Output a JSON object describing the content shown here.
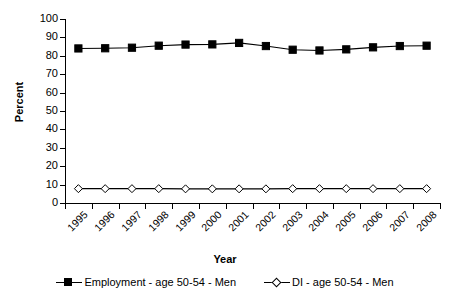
{
  "chart_data": {
    "type": "line",
    "title": "",
    "xlabel": "Year",
    "ylabel": "Percent",
    "ylim": [
      0,
      100
    ],
    "ytick_step": 10,
    "yticks": [
      0,
      10,
      20,
      30,
      40,
      50,
      60,
      70,
      80,
      90,
      100
    ],
    "grid": false,
    "legend_position": "bottom",
    "categories": [
      "1995",
      "1996",
      "1997",
      "1998",
      "1999",
      "2000",
      "2001",
      "2002",
      "2003",
      "2004",
      "2005",
      "2006",
      "2007",
      "2008"
    ],
    "series": [
      {
        "name": "Employment - age 50-54 - Men",
        "marker": "filled-square",
        "color": "#000000",
        "values": [
          84.0,
          84.1,
          84.4,
          85.5,
          86.1,
          86.2,
          87.0,
          85.3,
          83.3,
          82.9,
          83.5,
          84.6,
          85.3,
          85.5
        ]
      },
      {
        "name": "DI - age 50-54 - Men",
        "marker": "open-diamond",
        "color": "#000000",
        "values": [
          7.8,
          7.8,
          7.8,
          7.8,
          7.7,
          7.7,
          7.7,
          7.7,
          7.8,
          7.8,
          7.8,
          7.8,
          7.8,
          7.8
        ]
      }
    ]
  },
  "legend": {
    "entries": [
      {
        "label": "Employment - age 50-54 - Men",
        "marker": "filled-square"
      },
      {
        "label": "DI - age 50-54 - Men",
        "marker": "open-diamond"
      }
    ]
  },
  "axes": {
    "y_title": "Percent",
    "x_title": "Year"
  }
}
